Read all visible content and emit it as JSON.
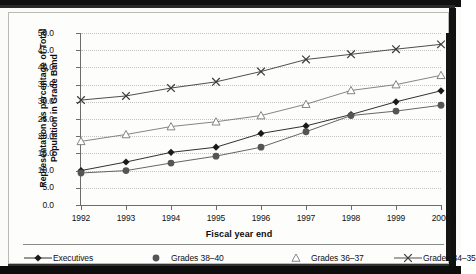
{
  "chart_data": {
    "type": "line",
    "title": "",
    "xlabel": "Fiscal year end",
    "ylabel": "Representation as percentage of Total Population in Grade Band",
    "categories": [
      "1992",
      "1993",
      "1994",
      "1995",
      "1996",
      "1997",
      "1998",
      "1999",
      "2000"
    ],
    "ylim": [
      0.0,
      50.0
    ],
    "ytick_step": 5.0,
    "yticks": [
      "0.0",
      "5.0",
      "10.0",
      "15.0",
      "20.0",
      "25.0",
      "30.0",
      "35.0",
      "40.0",
      "45.0",
      "50.0"
    ],
    "grid": true,
    "legend_position": "bottom",
    "series": [
      {
        "name": "Executives",
        "marker": "diamond",
        "color": "#1a1a1a",
        "values": [
          10.0,
          12.5,
          15.3,
          16.8,
          20.8,
          23.0,
          26.3,
          30.0,
          33.2
        ]
      },
      {
        "name": "Grades 38–40",
        "marker": "circle",
        "color": "#555555",
        "values": [
          9.3,
          10.0,
          12.2,
          14.2,
          16.8,
          21.3,
          26.0,
          27.3,
          29.0
        ]
      },
      {
        "name": "Grades 36–37",
        "marker": "triangle",
        "color": "#777777",
        "values": [
          18.5,
          20.5,
          22.8,
          24.2,
          26.0,
          29.3,
          33.3,
          35.0,
          37.7
        ]
      },
      {
        "name": "Grades 34–35",
        "marker": "cross",
        "color": "#3a3a3a",
        "values": [
          30.5,
          31.7,
          34.0,
          35.8,
          38.8,
          42.3,
          43.8,
          45.3,
          46.7
        ]
      }
    ]
  },
  "legend": {
    "items": [
      {
        "label": "Executives"
      },
      {
        "label": "Grades 38–40"
      },
      {
        "label": "Grades 36–37"
      },
      {
        "label": "Grades 34–35"
      }
    ]
  }
}
